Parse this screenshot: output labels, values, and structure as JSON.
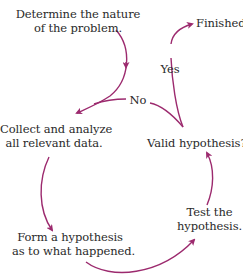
{
  "diagram": {
    "type": "cycle-flowchart",
    "arrow_color": "#9c2a6e",
    "nodes": [
      {
        "id": "determine",
        "line1": "Determine the nature",
        "line2": "of the problem."
      },
      {
        "id": "collect",
        "line1": "Collect and analyze",
        "line2": "all relevant data."
      },
      {
        "id": "form",
        "line1": "Form a hypothesis",
        "line2": "as to what happened."
      },
      {
        "id": "test",
        "line1": "Test the",
        "line2": "hypothesis."
      },
      {
        "id": "valid",
        "line1": "Valid hypothesis?"
      },
      {
        "id": "finished",
        "line1": "Finished"
      }
    ],
    "edge_labels": {
      "yes": "Yes",
      "no": "No"
    },
    "edges": [
      {
        "from": "determine",
        "to": "collect"
      },
      {
        "from": "collect",
        "to": "form"
      },
      {
        "from": "form",
        "to": "test"
      },
      {
        "from": "test",
        "to": "valid"
      },
      {
        "from": "valid",
        "to": "finished",
        "label": "Yes"
      },
      {
        "from": "valid",
        "to": "collect",
        "label": "No"
      }
    ]
  }
}
